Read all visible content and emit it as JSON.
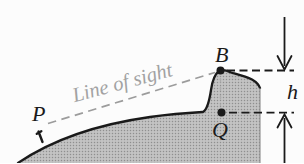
{
  "figure": {
    "type": "textbook-diagram",
    "labels": {
      "point_p": "P",
      "point_b": "B",
      "point_q": "Q",
      "height": "h",
      "sight_line": "Line of sight"
    },
    "colors": {
      "background": "#fcfcfc",
      "ink": "#1a1a1a",
      "terrain_base": "#c3c3c3",
      "terrain_dot": "#8f8f8f",
      "terrain_edge": "#8a8a8a",
      "sight_gray": "#9c9c9c",
      "faint_dash": "#ababab"
    }
  }
}
